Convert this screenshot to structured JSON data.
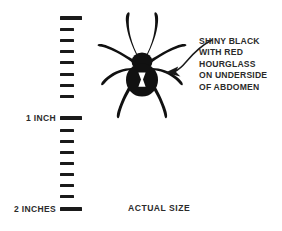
{
  "figure": {
    "background_color": "#ffffff",
    "ink_color": "#1a1a1a",
    "text_color": "#2b2b2b"
  },
  "ruler": {
    "name": "inch-ruler",
    "orientation": "vertical",
    "units": "inches",
    "total_inches": 2,
    "subdivisions_per_inch": 8,
    "tick_count": 17,
    "top_y": 16,
    "pixels_per_inch": 90,
    "labels": [
      {
        "text": "1 INCH",
        "at_inch": 1
      },
      {
        "text": "2 INCHES",
        "at_inch": 2
      }
    ],
    "ticks": [
      {
        "index": 0,
        "inch": 0.0,
        "major": true
      },
      {
        "index": 1,
        "inch": 0.125,
        "major": false
      },
      {
        "index": 2,
        "inch": 0.25,
        "major": false
      },
      {
        "index": 3,
        "inch": 0.375,
        "major": false
      },
      {
        "index": 4,
        "inch": 0.5,
        "major": false
      },
      {
        "index": 5,
        "inch": 0.625,
        "major": false
      },
      {
        "index": 6,
        "inch": 0.75,
        "major": false
      },
      {
        "index": 7,
        "inch": 0.875,
        "major": false
      },
      {
        "index": 8,
        "inch": 1.0,
        "major": true
      },
      {
        "index": 9,
        "inch": 1.125,
        "major": false
      },
      {
        "index": 10,
        "inch": 1.25,
        "major": false
      },
      {
        "index": 11,
        "inch": 1.375,
        "major": false
      },
      {
        "index": 12,
        "inch": 1.5,
        "major": false
      },
      {
        "index": 13,
        "inch": 1.625,
        "major": false
      },
      {
        "index": 14,
        "inch": 1.75,
        "major": false
      },
      {
        "index": 15,
        "inch": 1.875,
        "major": false
      },
      {
        "index": 16,
        "inch": 2.0,
        "major": true
      }
    ]
  },
  "spider": {
    "name": "black-widow-spider-illustration",
    "marking": "hourglass",
    "marking_color": "#ffffff",
    "body_color": "#111111"
  },
  "arrow": {
    "name": "callout-arrow",
    "points_to": "spider-abdomen",
    "direction": "right-to-left"
  },
  "callout": {
    "lines": [
      "SHINY BLACK",
      "WITH RED",
      "HOURGLASS",
      "ON UNDERSIDE",
      "OF ABDOMEN"
    ]
  },
  "caption": {
    "actual_size": "ACTUAL SIZE"
  }
}
